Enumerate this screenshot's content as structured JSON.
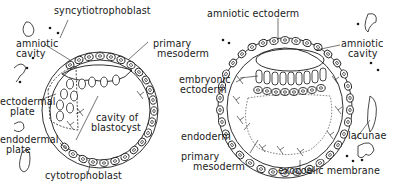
{
  "figure": {
    "colors": {
      "ink": "#1a1a1a",
      "background": "#ffffff"
    },
    "left_panel": {
      "labels": {
        "syncytiotrophoblast": "syncytiotrophoblast",
        "amniotic_cavity_1": "amniotic",
        "amniotic_cavity_2": "cavity",
        "primary_mesoderm_1": "primary",
        "primary_mesoderm_2": "mesoderm",
        "ectodermal_plate_1": "ectodermal",
        "ectodermal_plate_2": "plate",
        "cavity_of_blastocyst_1": "cavity of",
        "cavity_of_blastocyst_2": "blastocyst",
        "endodermal_plate_1": "endodermal",
        "endodermal_plate_2": "plate",
        "cytotrophoblast": "cytotrophoblast"
      }
    },
    "right_panel": {
      "labels": {
        "amniotic_ectoderm": "amniotic ectoderm",
        "embryonic_ectoderm_1": "embryonic",
        "embryonic_ectoderm_2": "ectoderm",
        "amniotic_cavity_1": "amniotic",
        "amniotic_cavity_2": "cavity",
        "endoderm": "endoderm",
        "primary_mesoderm_1": "primary",
        "primary_mesoderm_2": "mesoderm",
        "lacunae": "lacunae",
        "exocoelic_membrane": "exocoelic membrane"
      }
    }
  }
}
